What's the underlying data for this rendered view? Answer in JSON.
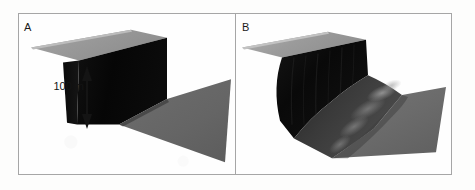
{
  "figure": {
    "background_color": "#fdfdfc",
    "frame_border_color": "#a6a6a6",
    "panel_divider_color": "#a6a6a6"
  },
  "panels": [
    {
      "id": "A",
      "label": "A",
      "caption_note": "",
      "scale_bar": {
        "label": "100 m",
        "orientation": "vertical",
        "arrow_style": "double-headed",
        "color": "#141414"
      },
      "surface": {
        "description": "sharp intact escarpment",
        "top_plateau_color": "#9a9a9a",
        "scarp_face_color": "#080808",
        "basin_floor_color": "#666666",
        "edge_highlight_color": "#b4b4b4"
      }
    },
    {
      "id": "B",
      "label": "B",
      "caption_note": "",
      "surface": {
        "description": "degraded slumped escarpment with mass-wasting deposit",
        "top_plateau_color": "#9a9a9a",
        "scarp_face_color": "#0d0d0d",
        "slump_deposit_color": "#3a3a3a",
        "basin_floor_color": "#6b6b6b",
        "edge_highlight_color": "#bdbdbd"
      }
    }
  ],
  "colors": {
    "light_gray": "#9a9a9a",
    "mid_gray": "#666666",
    "dark": "#080808",
    "text": "#141414"
  }
}
